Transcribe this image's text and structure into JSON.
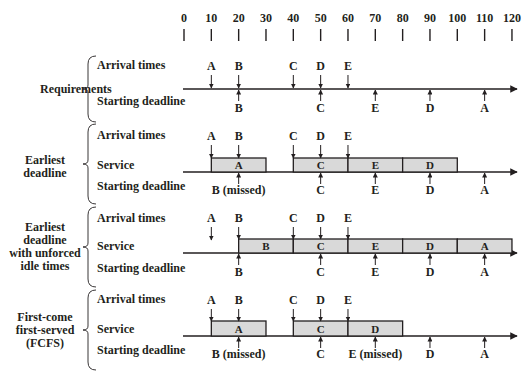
{
  "axis": {
    "ticks": [
      "0",
      "10",
      "20",
      "30",
      "40",
      "50",
      "60",
      "70",
      "80",
      "90",
      "100",
      "110",
      "120"
    ],
    "x0": 184,
    "unit_px": 2.733
  },
  "colors": {
    "ink": "#231f20",
    "box_fill": "#d9d9d9"
  },
  "sections": [
    {
      "group_label": [
        "Requirements"
      ],
      "row_labels": {
        "arrival": "Arrival times",
        "deadline": "Starting deadline"
      },
      "arrivals": [
        {
          "label": "A",
          "t": 10
        },
        {
          "label": "B",
          "t": 20
        },
        {
          "label": "C",
          "t": 40
        },
        {
          "label": "D",
          "t": 50
        },
        {
          "label": "E",
          "t": 60
        }
      ],
      "deadlines": [
        {
          "label": "B",
          "t": 20
        },
        {
          "label": "C",
          "t": 50
        },
        {
          "label": "E",
          "t": 70
        },
        {
          "label": "D",
          "t": 90
        },
        {
          "label": "A",
          "t": 110
        }
      ],
      "service": []
    },
    {
      "group_label": [
        "Earliest",
        "deadline"
      ],
      "row_labels": {
        "arrival": "Arrival times",
        "service": "Service",
        "deadline": "Starting deadline"
      },
      "arrivals": [
        {
          "label": "A",
          "t": 10
        },
        {
          "label": "B",
          "t": 20
        },
        {
          "label": "C",
          "t": 40
        },
        {
          "label": "D",
          "t": 50
        },
        {
          "label": "E",
          "t": 60
        }
      ],
      "service": [
        {
          "label": "A",
          "start": 10,
          "end": 30
        },
        {
          "label": "C",
          "start": 40,
          "end": 60
        },
        {
          "label": "E",
          "start": 60,
          "end": 80
        },
        {
          "label": "D",
          "start": 80,
          "end": 100
        }
      ],
      "deadlines": [
        {
          "label": "B (missed)",
          "t": 20
        },
        {
          "label": "C",
          "t": 50
        },
        {
          "label": "E",
          "t": 70
        },
        {
          "label": "D",
          "t": 90
        },
        {
          "label": "A",
          "t": 110
        }
      ]
    },
    {
      "group_label": [
        "Earliest",
        "deadline",
        "with unforced",
        "idle times"
      ],
      "row_labels": {
        "arrival": "Arrival times",
        "service": "Service",
        "deadline": "Starting deadline"
      },
      "arrivals": [
        {
          "label": "A",
          "t": 10
        },
        {
          "label": "B",
          "t": 20
        },
        {
          "label": "C",
          "t": 40
        },
        {
          "label": "D",
          "t": 50
        },
        {
          "label": "E",
          "t": 60
        }
      ],
      "service": [
        {
          "label": "B",
          "start": 20,
          "end": 40
        },
        {
          "label": "C",
          "start": 40,
          "end": 60
        },
        {
          "label": "E",
          "start": 60,
          "end": 80
        },
        {
          "label": "D",
          "start": 80,
          "end": 100
        },
        {
          "label": "A",
          "start": 100,
          "end": 120
        }
      ],
      "deadlines": [
        {
          "label": "B",
          "t": 20
        },
        {
          "label": "C",
          "t": 50
        },
        {
          "label": "E",
          "t": 70
        },
        {
          "label": "D",
          "t": 90
        },
        {
          "label": "A",
          "t": 110
        }
      ]
    },
    {
      "group_label": [
        "First-come",
        "first-served",
        "(FCFS)"
      ],
      "row_labels": {
        "arrival": "Arrival times",
        "service": "Service",
        "deadline": "Starting deadline"
      },
      "arrivals": [
        {
          "label": "A",
          "t": 10
        },
        {
          "label": "B",
          "t": 20
        },
        {
          "label": "C",
          "t": 40
        },
        {
          "label": "D",
          "t": 50
        },
        {
          "label": "E",
          "t": 60
        }
      ],
      "service": [
        {
          "label": "A",
          "start": 10,
          "end": 30
        },
        {
          "label": "C",
          "start": 40,
          "end": 60
        },
        {
          "label": "D",
          "start": 60,
          "end": 80
        }
      ],
      "deadlines": [
        {
          "label": "B (missed)",
          "t": 20
        },
        {
          "label": "C",
          "t": 50
        },
        {
          "label": "E (missed)",
          "t": 70
        },
        {
          "label": "D",
          "t": 90
        },
        {
          "label": "A",
          "t": 110
        }
      ]
    }
  ]
}
